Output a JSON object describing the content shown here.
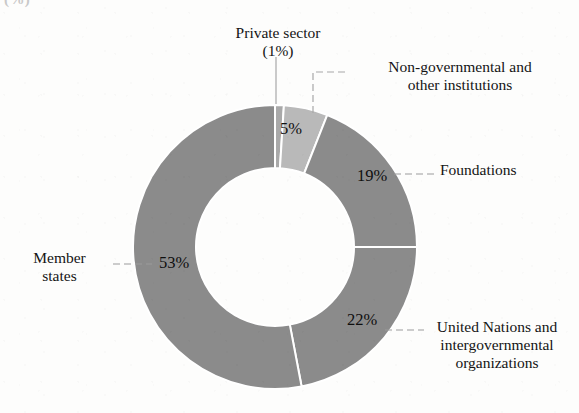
{
  "title_fragment": "(%)",
  "chart_data": {
    "type": "pie",
    "variant": "donut",
    "title": "",
    "subtitle": "",
    "xlabel": "",
    "ylabel": "",
    "legend_position": "callout-labels",
    "grid": false,
    "units": "percent",
    "start_angle_deg": 0,
    "direction": "clockwise",
    "center": {
      "x": 275,
      "y": 247
    },
    "outer_radius": 142,
    "inner_radius": 79,
    "categories": [
      "Private sector",
      "Non-governmental and other institutions",
      "Foundations",
      "United Nations and intergovernmental organizations",
      "Member states"
    ],
    "values": [
      1,
      5,
      19,
      22,
      53
    ],
    "value_labels": [
      "(1%)",
      "5%",
      "19%",
      "22%",
      "53%"
    ],
    "colors": [
      "#a9a9a9",
      "#b9b9b9",
      "#8b8b8b",
      "#8b8b8b",
      "#8b8b8b"
    ],
    "separator_color": "#ffffff",
    "slices": [
      {
        "name": "Private sector",
        "value": 1,
        "value_label": "(1%)",
        "color": "#a9a9a9",
        "label_lines": [
          "Private sector",
          "(1%)"
        ],
        "label_position": "top",
        "leader": "vertical",
        "inside_label_shown": false
      },
      {
        "name": "Non-governmental and other institutions",
        "value": 5,
        "value_label": "5%",
        "color": "#b9b9b9",
        "label_lines": [
          "Non-governmental and",
          "other institutions"
        ],
        "label_position": "top-right",
        "leader": "elbow",
        "inside_label_shown": true
      },
      {
        "name": "Foundations",
        "value": 19,
        "value_label": "19%",
        "color": "#8b8b8b",
        "label_lines": [
          "Foundations"
        ],
        "label_position": "right",
        "leader": "dashed",
        "inside_label_shown": true
      },
      {
        "name": "United Nations and intergovernmental organizations",
        "value": 22,
        "value_label": "22%",
        "color": "#8b8b8b",
        "label_lines": [
          "United Nations and",
          "intergovernmental",
          "organizations"
        ],
        "label_position": "bottom-right",
        "leader": "dashed",
        "inside_label_shown": true
      },
      {
        "name": "Member states",
        "value": 53,
        "value_label": "53%",
        "color": "#8b8b8b",
        "label_lines": [
          "Member",
          "states"
        ],
        "label_position": "left",
        "leader": "dashed",
        "inside_label_shown": true
      }
    ]
  },
  "labels": {
    "private_sector_line1": "Private sector",
    "private_sector_line2": "(1%)",
    "ngo": "Non-governmental and\nother institutions",
    "foundations": "Foundations",
    "united_nations": "United Nations and\nintergovernmental\norganizations",
    "member_states": "Member\nstates"
  },
  "percent_labels": {
    "ngo": "5%",
    "foundations": "19%",
    "united_nations": "22%",
    "member_states": "53%"
  },
  "colors": {
    "slice_dark": "#8b8b8b",
    "slice_light": "#b9b9b9",
    "slice_sliver": "#a9a9a9",
    "separator": "#ffffff",
    "text": "#141414",
    "leader_line": "#9a9a9a",
    "background": "#fdfdfc"
  }
}
